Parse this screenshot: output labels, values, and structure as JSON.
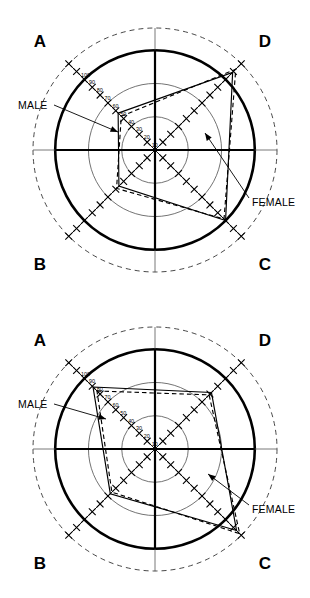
{
  "figure": {
    "title": "",
    "panels": [
      {
        "id": "panel-top",
        "quadrant_labels": {
          "a": "A",
          "b": "B",
          "c": "C",
          "d": "D"
        },
        "annotations": {
          "male": "MALE",
          "female": "FEMALE"
        }
      },
      {
        "id": "panel-bottom",
        "quadrant_labels": {
          "a": "A",
          "b": "B",
          "c": "C",
          "d": "D"
        },
        "annotations": {
          "male": "MALE",
          "female": "FEMALE"
        }
      }
    ]
  },
  "scale": {
    "ticks": [
      "100",
      "90",
      "80",
      "70",
      "60",
      "50",
      "40",
      "30",
      "20",
      "10"
    ],
    "max": 110,
    "bold_ring": 90,
    "thin_rings": [
      30,
      60
    ],
    "dashed_ring": 110,
    "tick_interval": 10
  },
  "chart_data": {
    "type": "line",
    "subtype": "polar-radar",
    "title": "",
    "xlabel": "",
    "ylabel": "",
    "categories": [
      "A",
      "D",
      "C",
      "B"
    ],
    "axis_angles_deg": [
      135,
      45,
      315,
      225
    ],
    "rlim": [
      0,
      110
    ],
    "rticks": [
      10,
      20,
      30,
      40,
      50,
      60,
      70,
      80,
      90,
      100
    ],
    "grid": true,
    "legend": [
      "MALE",
      "FEMALE"
    ],
    "legend_position": "annotated-inline",
    "panels": [
      {
        "panel": "top",
        "quadrants": [
          "A",
          "D",
          "C",
          "B"
        ],
        "series": [
          {
            "name": "MALE",
            "style": "solid",
            "values": [
              47,
              99,
              90,
              46
            ]
          },
          {
            "name": "FEMALE",
            "style": "dashed",
            "values": [
              43,
              103,
              88,
              49
            ]
          }
        ]
      },
      {
        "panel": "bottom",
        "quadrants": [
          "A",
          "D",
          "C",
          "B"
        ],
        "series": [
          {
            "name": "MALE",
            "style": "solid",
            "values": [
              79,
              72,
              104,
              57
            ]
          },
          {
            "name": "FEMALE",
            "style": "dashed",
            "values": [
              74,
              69,
              108,
              55
            ]
          }
        ]
      }
    ]
  }
}
